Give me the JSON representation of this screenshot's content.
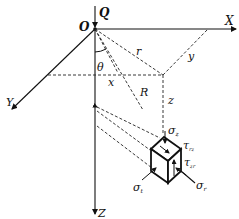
{
  "diagram": {
    "labels": {
      "origin": "O",
      "load": "Q",
      "x_axis": "X",
      "y_axis": "Y",
      "z_axis": "Z",
      "theta": "θ",
      "r": "r",
      "R": "R",
      "x": "x",
      "y": "y",
      "z": "z",
      "sigma_z": "σ",
      "sigma_z_sub": "z",
      "tau_rz": "τ",
      "tau_rz_sub": "rz",
      "tau_zr": "τ",
      "tau_zr_sub": "zr",
      "sigma_t": "σ",
      "sigma_t_sub": "t",
      "sigma_r": "σ",
      "sigma_r_sub": "r"
    },
    "colors": {
      "line": "#111111",
      "background": "#ffffff"
    }
  }
}
